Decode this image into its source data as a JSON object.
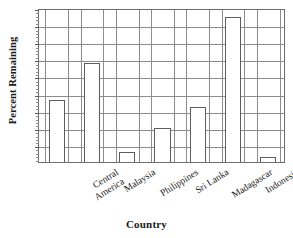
{
  "chart_data": {
    "type": "bar",
    "title": "",
    "xlabel": "Country",
    "ylabel": "Percent Remaining",
    "categories": [
      "Central America",
      "Malaysia",
      "Philippines",
      "Sri Lanka",
      "Madagascar",
      "Indonesia",
      "Brazil"
    ],
    "values": [
      18,
      29,
      3,
      10,
      16,
      42.5,
      1.5
    ],
    "ylim": [
      0,
      45
    ],
    "ytick_values": [
      5,
      10,
      15,
      20,
      25,
      30,
      35,
      40,
      45
    ],
    "ytick_labels": [
      "5",
      "10",
      "15",
      "20",
      "25",
      "30",
      "35",
      "40",
      "45"
    ],
    "grid": "both",
    "legend": "none",
    "bar_fill_color": "#ffffff",
    "bar_edge_color": "#5e5e5e",
    "grid_color": "#8d8d8d",
    "axis_color": "#6e6e6e",
    "text_color": "#1a1a1a"
  },
  "axis_titles": {
    "y": "Percent Remaining",
    "x": "Country"
  },
  "category_labels": [
    {
      "line1": "Central",
      "line2": "America"
    },
    {
      "line1": "Malaysia",
      "line2": ""
    },
    {
      "line1": "Philippines",
      "line2": ""
    },
    {
      "line1": "Sri Lanka",
      "line2": ""
    },
    {
      "line1": "Madagascar",
      "line2": ""
    },
    {
      "line1": "Indonesia",
      "line2": ""
    },
    {
      "line1": "Brazil",
      "line2": ""
    }
  ]
}
